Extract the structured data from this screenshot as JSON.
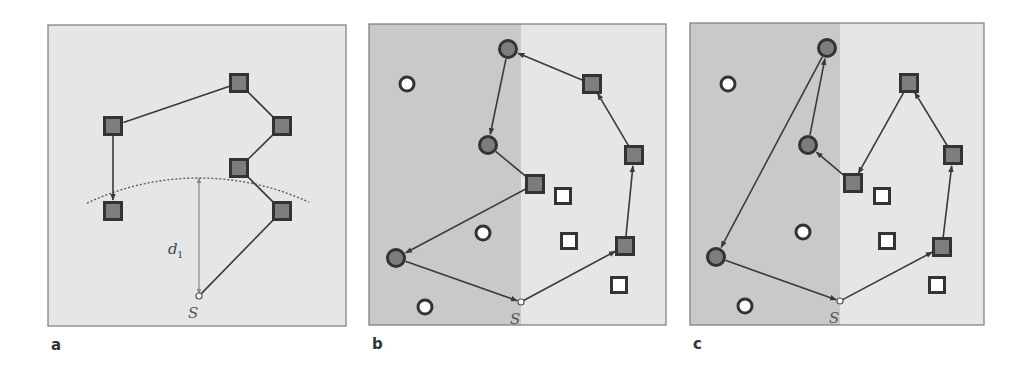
{
  "figure": {
    "colors": {
      "panel_bg_light": "#e6e6e6",
      "panel_bg_dark": "#c9c9c9",
      "panel_border": "#7a7a7a",
      "node_fill": "#7d7d7d",
      "node_stroke": "#333333",
      "empty_node_fill": "#ffffff",
      "edge": "#3a3a3a",
      "arc": "#555555",
      "dimension_line": "#888888"
    },
    "panels": [
      {
        "id": "a",
        "label": "a",
        "rect": [
          48,
          25,
          298,
          301
        ],
        "split_x": null,
        "start": {
          "label": "S",
          "x": 199,
          "y": 296
        },
        "arc": {
          "cx": 199,
          "cy": 440,
          "r": 262,
          "from_x": 87,
          "to_x": 309
        },
        "dimension": {
          "label": "d",
          "subscript": "1",
          "x": 199,
          "y1": 178,
          "y2": 294,
          "label_x": 168,
          "label_y": 254
        },
        "filled_squares": [
          [
            239,
            83
          ],
          [
            113,
            126
          ],
          [
            282,
            126
          ],
          [
            239,
            168
          ],
          [
            113,
            211
          ],
          [
            282,
            211
          ]
        ],
        "filled_circles": [],
        "empty_squares": [],
        "empty_circles": [],
        "path": [
          [
            199,
            296
          ],
          [
            282,
            211
          ],
          [
            239,
            168
          ],
          [
            282,
            126
          ],
          [
            239,
            83
          ],
          [
            113,
            126
          ],
          [
            113,
            211
          ]
        ],
        "arrowheads_on_segments": [
          5,
          6
        ]
      },
      {
        "id": "b",
        "label": "b",
        "rect": [
          369,
          24,
          297,
          301
        ],
        "split_x": 521,
        "start": {
          "label": "S",
          "x": 521,
          "y": 302
        },
        "filled_squares": [
          [
            592,
            84
          ],
          [
            634,
            155
          ],
          [
            535,
            184
          ],
          [
            625,
            246
          ]
        ],
        "filled_circles": [
          [
            508,
            49
          ],
          [
            488,
            145
          ],
          [
            396,
            258
          ]
        ],
        "empty_squares": [
          [
            563,
            196
          ],
          [
            569,
            241
          ],
          [
            619,
            285
          ]
        ],
        "empty_circles": [
          [
            407,
            84
          ],
          [
            483,
            233
          ],
          [
            425,
            307
          ]
        ],
        "path": [
          [
            521,
            302
          ],
          [
            625,
            246
          ],
          [
            634,
            155
          ],
          [
            592,
            84
          ],
          [
            508,
            49
          ],
          [
            488,
            145
          ],
          [
            535,
            184
          ],
          [
            396,
            258
          ],
          [
            521,
            302
          ]
        ],
        "arrowheads_on_segments": [
          0,
          1,
          2,
          3,
          4,
          6,
          7
        ]
      },
      {
        "id": "c",
        "label": "c",
        "rect": [
          690,
          23,
          294,
          302
        ],
        "split_x": 840,
        "start": {
          "label": "S",
          "x": 840,
          "y": 301
        },
        "filled_squares": [
          [
            909,
            83
          ],
          [
            953,
            155
          ],
          [
            853,
            183
          ],
          [
            942,
            247
          ]
        ],
        "filled_circles": [
          [
            827,
            48
          ],
          [
            808,
            145
          ],
          [
            716,
            257
          ]
        ],
        "empty_squares": [
          [
            882,
            196
          ],
          [
            887,
            241
          ],
          [
            937,
            285
          ]
        ],
        "empty_circles": [
          [
            728,
            84
          ],
          [
            803,
            232
          ],
          [
            745,
            306
          ]
        ],
        "path": [
          [
            840,
            301
          ],
          [
            942,
            247
          ],
          [
            953,
            155
          ],
          [
            909,
            83
          ],
          [
            853,
            183
          ],
          [
            808,
            145
          ],
          [
            827,
            48
          ],
          [
            716,
            257
          ],
          [
            840,
            301
          ]
        ],
        "arrowheads_on_segments": [
          0,
          1,
          2,
          3,
          4,
          5,
          6,
          7
        ]
      }
    ]
  }
}
